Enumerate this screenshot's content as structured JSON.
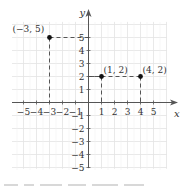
{
  "chart_data": {
    "type": "scatter",
    "title": "",
    "xlabel": "x",
    "ylabel": "y",
    "xlim": [
      -6,
      6
    ],
    "ylim": [
      -5,
      6
    ],
    "grid": true,
    "x_ticks": [
      -5,
      -4,
      -3,
      -2,
      -1,
      1,
      2,
      3,
      4,
      5
    ],
    "x_tick_labels": [
      "−5",
      "−4",
      "−3",
      "−2",
      "−1",
      "1",
      "2",
      "3",
      "4",
      "5"
    ],
    "y_ticks": [
      5,
      4,
      3,
      2,
      1,
      -1,
      -2,
      -3,
      -4,
      -5
    ],
    "y_tick_labels": [
      "5",
      "4",
      "3",
      "2",
      "1",
      "−1",
      "−2",
      "−3",
      "−4",
      "−5"
    ],
    "points": [
      {
        "x": -3,
        "y": 5,
        "label": "(−3, 5)"
      },
      {
        "x": 1,
        "y": 2,
        "label": "(1, 2)"
      },
      {
        "x": 4,
        "y": 2,
        "label": "(4, 2)"
      }
    ],
    "projections": "dashed lines from each point to both axes"
  },
  "colors": {
    "grid": "#e3e3e3",
    "axis": "#555555",
    "point": "#111111",
    "dash": "#444444",
    "text": "#333333"
  }
}
